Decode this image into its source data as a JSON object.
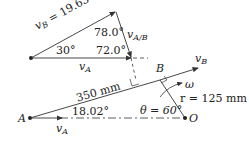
{
  "velocity_triangle": {
    "vB_label": "v",
    "vB_sub": "B",
    "vB_value": " = 19.63 m/s",
    "vAB_label": "v",
    "vAB_sub": "A/B",
    "vA_label": "v",
    "vA_sub": "A",
    "angle_top": "78.0°",
    "angle_left": "30°",
    "angle_right": "72.0°"
  },
  "mechanism": {
    "point_A": "A",
    "point_B": "B",
    "point_O": "O",
    "link_length": "350 mm",
    "angle_A": "18.02°",
    "theta": "θ = 60°",
    "radius": "r = 125 mm",
    "omega": "ω",
    "vA_label": "v",
    "vA_sub": "A",
    "vB_label": "v",
    "vB_sub": "B"
  },
  "colors": {
    "line": "#333333",
    "text": "#222222"
  }
}
